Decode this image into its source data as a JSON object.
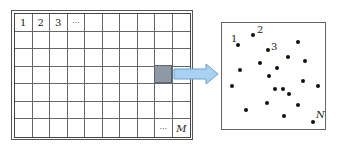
{
  "grid": {
    "columns": 10,
    "rows": 7,
    "first_row_labels": [
      "1",
      "2",
      "3",
      "···"
    ],
    "last_cell_labels": [
      "···",
      "M"
    ],
    "highlighted_cell": {
      "row": 4,
      "col": 9,
      "color": "#8e99a5"
    }
  },
  "arrow": {
    "fill": "#a9d2f2",
    "stroke": "#6b9fcf",
    "direction": "right"
  },
  "points_panel": {
    "labels": [
      {
        "text": "1",
        "x": 9,
        "y": 11,
        "italic": false
      },
      {
        "text": "2",
        "x": 35,
        "y": 2,
        "italic": false
      },
      {
        "text": "3",
        "x": 49,
        "y": 19,
        "italic": false
      },
      {
        "text": "N",
        "x": 94,
        "y": 87,
        "italic": true
      }
    ],
    "dots": [
      {
        "x": 16,
        "y": 22
      },
      {
        "x": 31,
        "y": 12
      },
      {
        "x": 46,
        "y": 27
      },
      {
        "x": 76,
        "y": 19
      },
      {
        "x": 66,
        "y": 34
      },
      {
        "x": 38,
        "y": 40
      },
      {
        "x": 83,
        "y": 38
      },
      {
        "x": 18,
        "y": 47
      },
      {
        "x": 55,
        "y": 45
      },
      {
        "x": 47,
        "y": 53
      },
      {
        "x": 81,
        "y": 58
      },
      {
        "x": 10,
        "y": 63
      },
      {
        "x": 53,
        "y": 66
      },
      {
        "x": 61,
        "y": 66
      },
      {
        "x": 96,
        "y": 63
      },
      {
        "x": 67,
        "y": 71
      },
      {
        "x": 45,
        "y": 80
      },
      {
        "x": 76,
        "y": 82
      },
      {
        "x": 24,
        "y": 87
      },
      {
        "x": 62,
        "y": 93
      },
      {
        "x": 91,
        "y": 99
      }
    ]
  }
}
